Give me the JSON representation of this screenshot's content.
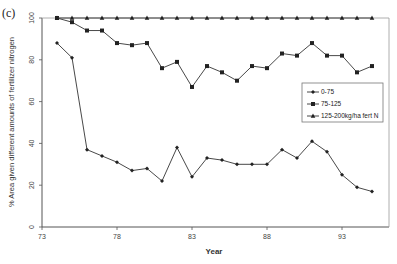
{
  "panel_label": "(c)",
  "chart_data": {
    "type": "line",
    "title": "",
    "xlabel": "Year",
    "ylabel": "% Area given different amounts of fertilizer nitrogen",
    "xlim": [
      73,
      96
    ],
    "ylim": [
      0,
      100
    ],
    "x_ticks": [
      73,
      78,
      83,
      88,
      93
    ],
    "y_ticks": [
      0,
      20,
      40,
      60,
      80,
      100
    ],
    "grid": false,
    "legend_position": "right-middle inside",
    "x": [
      74,
      75,
      76,
      77,
      78,
      79,
      80,
      81,
      82,
      83,
      84,
      85,
      86,
      87,
      88,
      89,
      90,
      91,
      92,
      93,
      94,
      95
    ],
    "series": [
      {
        "name": "0-75",
        "marker": "diamond",
        "values": [
          88,
          81,
          37,
          34,
          31,
          27,
          28,
          22,
          38,
          24,
          33,
          32,
          30,
          30,
          30,
          37,
          33,
          41,
          36,
          25,
          19,
          17
        ]
      },
      {
        "name": "75-125",
        "marker": "square",
        "values": [
          100,
          98,
          94,
          94,
          88,
          87,
          88,
          76,
          79,
          67,
          77,
          74,
          70,
          77,
          76,
          83,
          82,
          88,
          82,
          82,
          74,
          77
        ]
      },
      {
        "name": "125-200kg/ha fert N",
        "marker": "triangle",
        "values": [
          100,
          100,
          100,
          100,
          100,
          100,
          100,
          100,
          100,
          100,
          100,
          100,
          100,
          100,
          100,
          100,
          100,
          100,
          100,
          100,
          100,
          100
        ]
      }
    ]
  }
}
